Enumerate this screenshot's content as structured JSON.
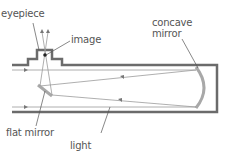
{
  "diagram": {
    "labels": {
      "eyepiece": "eyepiece",
      "image": "image",
      "concave_mirror_line1": "concave",
      "concave_mirror_line2": "mirror",
      "flat_mirror": "flat mirror",
      "light": "light"
    },
    "colors": {
      "tube": "#6b6b6b",
      "mirror": "#a8a8a8",
      "ray": "#9a9a9a",
      "leader": "#555555",
      "text": "#555555"
    }
  }
}
